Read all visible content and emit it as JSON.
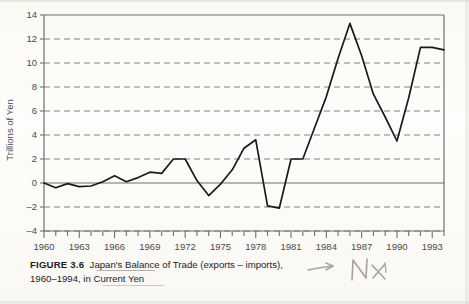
{
  "figure": {
    "number_label": "FIGURE 3.6",
    "caption_line1": "Japan's Balance of Trade (exports – imports),",
    "caption_line2": "1960–1994, in Current Yen",
    "handwritten_annotation": "NX",
    "handwritten_arrow": "arrow-right"
  },
  "colors": {
    "line": "#1a1a1a",
    "grid": "#6f6f6f",
    "axis": "#6f6f6f",
    "zero_line": "#6f6f6f",
    "text": "#4a4a4a",
    "caption_text": "#1d1d1d",
    "pencil": "#a9a59c"
  },
  "chart_data": {
    "type": "line",
    "title": "Japan's Balance of Trade (exports – imports), 1960–1994, in Current Yen",
    "xlabel": "",
    "ylabel": "Trillions of Yen",
    "xlim": [
      1960,
      1994
    ],
    "ylim": [
      -4,
      14
    ],
    "ytick_labels": [
      "14",
      "12",
      "10",
      "8",
      "6",
      "4",
      "2",
      "0",
      "–2",
      "–4"
    ],
    "yticks": [
      14,
      12,
      10,
      8,
      6,
      4,
      2,
      0,
      -2,
      -4
    ],
    "xtick_labels": [
      "1960",
      "1963",
      "1966",
      "1969",
      "1972",
      "1975",
      "1978",
      "1981",
      "1984",
      "1987",
      "1990",
      "1993"
    ],
    "xticks": [
      1960,
      1963,
      1966,
      1969,
      1972,
      1975,
      1978,
      1981,
      1984,
      1987,
      1990,
      1993
    ],
    "x_minor_tick_step": 1,
    "grid": "horizontal-dashed",
    "zero_line": true,
    "legend": "none",
    "x": [
      1960,
      1961,
      1962,
      1963,
      1964,
      1965,
      1966,
      1967,
      1968,
      1969,
      1970,
      1971,
      1972,
      1973,
      1974,
      1975,
      1976,
      1977,
      1978,
      1979,
      1980,
      1981,
      1982,
      1983,
      1984,
      1985,
      1986,
      1987,
      1988,
      1989,
      1990,
      1991,
      1992,
      1993,
      1994
    ],
    "values": [
      0.0,
      -0.4,
      -0.05,
      -0.3,
      -0.25,
      0.1,
      0.6,
      0.1,
      0.45,
      0.9,
      0.8,
      2.0,
      2.0,
      0.2,
      -1.05,
      -0.1,
      1.1,
      2.9,
      3.6,
      -1.9,
      -2.1,
      2.0,
      2.0,
      4.6,
      7.2,
      10.4,
      13.3,
      10.6,
      7.4,
      5.5,
      3.5,
      7.1,
      11.3,
      11.3,
      11.1
    ]
  }
}
